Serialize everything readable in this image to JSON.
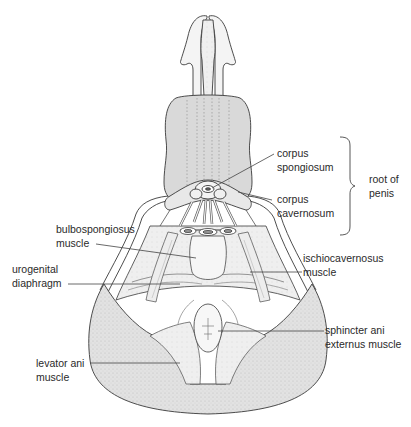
{
  "figure": {
    "colors": {
      "line": "#3a3a3a",
      "shade": "#d8d8d8",
      "light_shade": "#e9e9e9",
      "text": "#2a2a2a",
      "background": "#ffffff"
    }
  },
  "labels": {
    "corpus_spongiosum": {
      "line1": "corpus",
      "line2": "spongiosum"
    },
    "corpus_cavernosum": {
      "line1": "corpus",
      "line2": "cavernosum"
    },
    "root_of_penis": {
      "line1": "root of",
      "line2": "penis"
    },
    "bulbospongiosus": {
      "line1": "bulbospongiosus",
      "line2": "muscle"
    },
    "urogenital_diaphragm": {
      "line1": "urogenital",
      "line2": "diaphragm"
    },
    "ischiocavernosus": {
      "line1": "ischiocavernosus",
      "line2": "muscle"
    },
    "sphincter_ani": {
      "line1": "sphincter ani",
      "line2": "externus muscle"
    },
    "levator_ani": {
      "line1": "levator ani",
      "line2": "muscle"
    }
  }
}
